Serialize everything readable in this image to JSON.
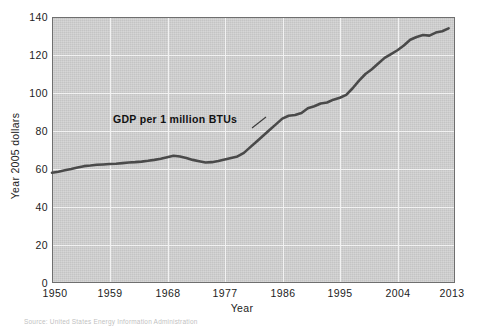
{
  "chart_data": {
    "type": "line",
    "title": "",
    "xlabel": "Year",
    "ylabel": "Year 2005 dollars",
    "xlim": [
      1950,
      2013
    ],
    "ylim": [
      0,
      140
    ],
    "grid": true,
    "legend_position": "inline-annotation",
    "xticks": [
      "1950",
      "1959",
      "1968",
      "1977",
      "1986",
      "1995",
      "2004",
      "2013"
    ],
    "yticks": [
      "0",
      "20",
      "40",
      "60",
      "80",
      "100",
      "120",
      "140"
    ],
    "series": [
      {
        "name": "GDP per 1 million BTUs",
        "x": [
          1950,
          1951,
          1952,
          1953,
          1954,
          1955,
          1956,
          1957,
          1958,
          1959,
          1960,
          1961,
          1962,
          1963,
          1964,
          1965,
          1966,
          1967,
          1968,
          1969,
          1970,
          1971,
          1972,
          1973,
          1974,
          1975,
          1976,
          1977,
          1978,
          1979,
          1980,
          1981,
          1982,
          1983,
          1984,
          1985,
          1986,
          1987,
          1988,
          1989,
          1990,
          1991,
          1992,
          1993,
          1994,
          1995,
          1996,
          1997,
          1998,
          1999,
          2000,
          2001,
          2002,
          2003,
          2004,
          2005,
          2006,
          2007,
          2008,
          2009,
          2010,
          2011,
          2012
        ],
        "values": [
          58.0,
          58.6,
          59.3,
          60.0,
          60.8,
          61.5,
          61.8,
          62.2,
          62.4,
          62.6,
          62.8,
          63.1,
          63.4,
          63.6,
          63.9,
          64.3,
          64.8,
          65.4,
          66.2,
          67.0,
          66.6,
          65.8,
          64.8,
          64.1,
          63.4,
          63.6,
          64.2,
          65.0,
          65.8,
          66.6,
          68.5,
          71.5,
          74.5,
          77.5,
          80.5,
          83.5,
          86.5,
          88.0,
          88.4,
          89.5,
          92.0,
          93.0,
          94.5,
          95.0,
          96.5,
          97.5,
          99.0,
          102.5,
          106.5,
          110.0,
          112.5,
          115.5,
          118.5,
          120.5,
          122.5,
          125.0,
          128.0,
          129.5,
          130.5,
          130.2,
          131.8,
          132.5,
          134.0
        ]
      }
    ],
    "annotation": {
      "text": "GDP per 1 million BTUs",
      "leader_from": [
        252,
        128
      ],
      "leader_to": [
        266,
        117
      ]
    },
    "colors": {
      "plot_background": "#d2d2d2",
      "gridline": "#f2f2f2",
      "line": "#4a4a4a",
      "frame": "#6f6f6f",
      "text": "#1c1c1c"
    }
  },
  "axes": {
    "x_title": "Year",
    "y_title": "Year 2005 dollars"
  },
  "footer": {
    "source": "Source: United States Energy Information Administration"
  }
}
